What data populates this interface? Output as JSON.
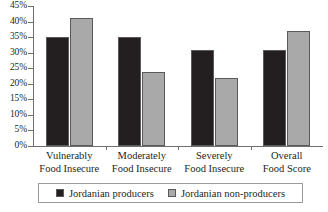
{
  "chart_data": {
    "type": "bar",
    "title": "",
    "subtitle": "",
    "xlabel": "",
    "ylabel": "",
    "ylim": [
      0,
      45
    ],
    "ytick_labels": [
      "45%",
      "40%",
      "35%",
      "30%",
      "25%",
      "20%",
      "15%",
      "10%",
      "5%",
      "0%"
    ],
    "ytick_values": [
      45,
      40,
      35,
      30,
      25,
      20,
      15,
      10,
      5,
      0
    ],
    "grid": false,
    "legend_position": "bottom",
    "categories": [
      "Vulnerably Food Insecure",
      "Moderately Food Insecure",
      "Severely Food Insecure",
      "Overall Food Score"
    ],
    "category_lines": [
      [
        "Vulnerably",
        "Food Insecure"
      ],
      [
        "Moderately",
        "Food Insecure"
      ],
      [
        "Severely",
        "Food Insecure"
      ],
      [
        "Overall",
        "Food Score"
      ]
    ],
    "series": [
      {
        "name": "Jordanian producers",
        "color": "#231f20",
        "values": [
          35,
          35,
          31,
          31
        ]
      },
      {
        "name": "Jordanian non-producers",
        "color": "#a9a9a9",
        "values": [
          41,
          23.7,
          22,
          37
        ]
      }
    ]
  },
  "legend": {
    "items": [
      {
        "label": "Jordanian producers",
        "swatch": "dark-swatch"
      },
      {
        "label": "Jordanian non-producers",
        "swatch": "light-swatch"
      }
    ]
  }
}
